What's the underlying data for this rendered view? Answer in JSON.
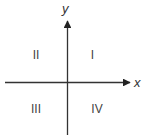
{
  "diagram": {
    "axes": {
      "x_label": "x",
      "y_label": "y"
    },
    "quadrants": {
      "top_right": "I",
      "top_left": "II",
      "bottom_left": "III",
      "bottom_right": "IV"
    },
    "colors": {
      "axis": "#333333",
      "text": "#444444"
    }
  }
}
